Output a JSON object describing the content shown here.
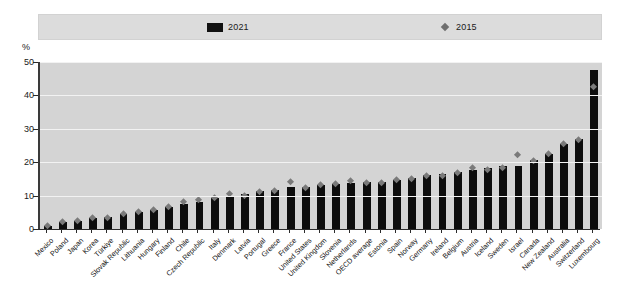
{
  "legend": {
    "series_2021_label": "2021",
    "series_2015_label": "2015",
    "swatch_2021_icon": "black-square-icon",
    "marker_2015_icon": "diamond-marker-icon"
  },
  "axis": {
    "unit_label": "%",
    "y_ticks": [
      "0",
      "10",
      "20",
      "30",
      "40",
      "50"
    ]
  },
  "chart_data": {
    "type": "bar",
    "title": "",
    "subtitle": "",
    "xlabel": "",
    "ylabel": "%",
    "ylim": [
      0,
      50
    ],
    "grid": true,
    "legend_position": "top",
    "categories": [
      "Mexico",
      "Poland",
      "Japan",
      "Korea",
      "Türkiye",
      "Slovak Republic",
      "Lithuania",
      "Hungary",
      "Finland",
      "Chile",
      "Czech Republic",
      "Italy",
      "Denmark",
      "Latvia",
      "Portugal",
      "Greece",
      "France",
      "United States",
      "United Kingdom",
      "Slovenia",
      "Netherlands",
      "OECD average",
      "Estonia",
      "Spain",
      "Norway",
      "Germany",
      "Ireland",
      "Belgium",
      "Austria",
      "Iceland",
      "Sweden",
      "Israel",
      "Canada",
      "New Zealand",
      "Australia",
      "Switzerland",
      "Luxembourg"
    ],
    "series": [
      {
        "name": "2021",
        "type": "bar",
        "color": "#0d0d0d",
        "values": [
          0.8,
          2.2,
          2.5,
          3.3,
          3.5,
          4.6,
          5.2,
          5.8,
          6.6,
          7.4,
          8.0,
          9.4,
          9.7,
          10.6,
          11.3,
          11.6,
          12.6,
          12.7,
          13.3,
          13.6,
          13.8,
          14.0,
          14.2,
          14.8,
          15.3,
          16.2,
          16.4,
          17.2,
          17.8,
          18.3,
          18.8,
          19.0,
          20.6,
          22.6,
          25.6,
          27.0,
          47.5
        ]
      },
      {
        "name": "2015",
        "type": "scatter",
        "color": "#7a7a7a",
        "marker": "diamond",
        "values": [
          0.9,
          2.0,
          2.2,
          3.0,
          3.2,
          4.3,
          5.0,
          5.6,
          6.4,
          7.8,
          8.4,
          9.0,
          10.2,
          9.7,
          11.0,
          11.2,
          14.0,
          12.2,
          13.0,
          13.2,
          14.3,
          13.6,
          13.5,
          14.4,
          14.7,
          15.6,
          15.7,
          16.6,
          18.2,
          17.4,
          18.2,
          22.0,
          20.2,
          22.2,
          25.4,
          26.6,
          42.3
        ]
      }
    ]
  }
}
